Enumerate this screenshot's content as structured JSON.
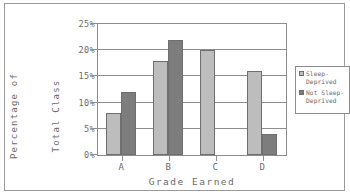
{
  "chart_data": {
    "type": "bar",
    "title": "",
    "categories": [
      "A",
      "B",
      "C",
      "D"
    ],
    "series": [
      {
        "name": "Sleep-Deprived",
        "color": "#bdbdbd",
        "values": [
          8,
          18,
          20,
          16
        ]
      },
      {
        "name": "Not Sleep-Deprived",
        "color": "#7d7d7d",
        "values": [
          12,
          22,
          0,
          4
        ]
      }
    ],
    "xlabel": "Grade Earned",
    "ylabel_lines": [
      "Percentage of",
      "Total Class"
    ],
    "ylabel": "Percentage of Total Class",
    "ylim": [
      0,
      25
    ],
    "ytick_values": [
      25,
      20,
      15,
      10,
      5,
      0
    ],
    "ytick_labels": [
      "25%",
      "20%",
      "15%",
      "10%",
      "5%",
      "0%"
    ],
    "grid": true,
    "legend_position": "right",
    "legend_entries": [
      "Sleep-Deprived",
      "Not Sleep-Deprived"
    ]
  },
  "legend": {
    "entry_0": "Sleep-Deprived",
    "entry_1": "Not Sleep-Deprived"
  }
}
